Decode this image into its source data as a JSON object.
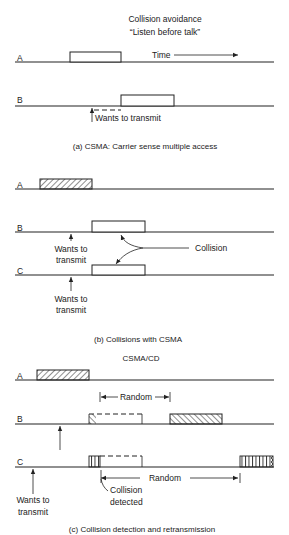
{
  "panel_a": {
    "title_line1": "Collision avoidance",
    "title_line2": "“Listen before talk”",
    "station_a": "A",
    "station_b": "B",
    "time_label": "Time",
    "wants_label": "Wants to transmit",
    "caption": "(a)  CSMA: Carrier sense multiple access"
  },
  "panel_b": {
    "station_a": "A",
    "station_b": "B",
    "station_c": "C",
    "wants_b_line1": "Wants to",
    "wants_b_line2": "transmit",
    "wants_c_line1": "Wants to",
    "wants_c_line2": "transmit",
    "collision_label": "Collision",
    "caption": "(b)  Collisions with CSMA"
  },
  "panel_c": {
    "title": "CSMA/CD",
    "station_a": "A",
    "station_b": "B",
    "station_c": "C",
    "random_b": "Random",
    "random_c": "Random",
    "collision_line1": "Collision",
    "collision_line2": "detected",
    "wants_line1": "Wants to",
    "wants_line2": "transmit",
    "caption": "(c)  Collision detection and retransmission"
  }
}
